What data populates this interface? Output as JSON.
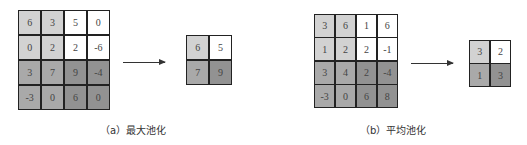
{
  "colors": {
    "top_left": "#d2d2d2",
    "top_right": "#ffffff",
    "bottom_left": "#a9a9a9",
    "bottom_right": "#929292",
    "border": "#222222"
  },
  "max_pooling": {
    "caption": "（a）最大池化",
    "input": [
      [
        "6",
        "3",
        "5",
        "0"
      ],
      [
        "0",
        "2",
        "2",
        "-6"
      ],
      [
        "3",
        "7",
        "9",
        "-4"
      ],
      [
        "-3",
        "0",
        "6",
        "0"
      ]
    ],
    "output": [
      [
        "6",
        "5"
      ],
      [
        "7",
        "9"
      ]
    ]
  },
  "average_pooling": {
    "caption": "（b）平均池化",
    "input": [
      [
        "3",
        "6",
        "1",
        "6"
      ],
      [
        "1",
        "2",
        "2",
        "-1"
      ],
      [
        "3",
        "4",
        "2",
        "-4"
      ],
      [
        "-3",
        "0",
        "6",
        "8"
      ]
    ],
    "output": [
      [
        "3",
        "2"
      ],
      [
        "1",
        "3"
      ]
    ]
  }
}
